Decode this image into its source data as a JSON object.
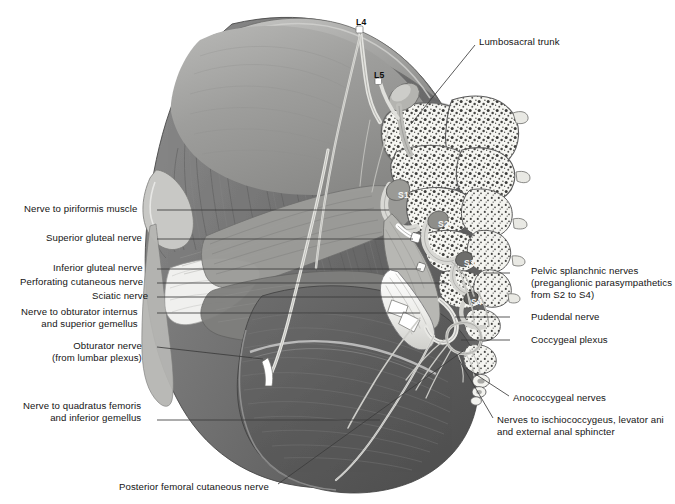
{
  "figure": {
    "background_color": "#ffffff",
    "line_color": "#3a3a3a",
    "muscle_color": "#6e6e6e",
    "bone_color": "#f2f2f0",
    "nerve_color": "#fdfdfb"
  },
  "labels_left": [
    {
      "id": "nerve-to-piriformis-muscle",
      "text": "Nerve to piriformis muscle",
      "x": 24,
      "y": 203,
      "width": 129,
      "leader_from_x": 157,
      "leader_from_y": 210,
      "leader_to_x": 389,
      "leader_to_y": 210
    },
    {
      "id": "superior-gluteal-nerve",
      "text": "Superior gluteal nerve",
      "x": 46,
      "y": 232,
      "width": 107,
      "leader_from_x": 157,
      "leader_from_y": 239,
      "leader_to_x": 413,
      "leader_to_y": 239
    },
    {
      "id": "inferior-gluteal-nerve",
      "text": "Inferior gluteal nerve",
      "x": 53,
      "y": 262,
      "width": 100,
      "leader_from_x": 157,
      "leader_from_y": 269,
      "leader_to_x": 421,
      "leader_to_y": 269
    },
    {
      "id": "perforating-cutaneous-nerve",
      "text": "Perforating cutaneous nerve",
      "x": 20,
      "y": 276,
      "width": 133,
      "leader_from_x": 157,
      "leader_from_y": 283,
      "leader_to_x": 447,
      "leader_to_y": 283
    },
    {
      "id": "sciatic-nerve",
      "text": "Sciatic nerve",
      "x": 92,
      "y": 290,
      "width": 61,
      "leader_from_x": 157,
      "leader_from_y": 297,
      "leader_to_x": 437,
      "leader_to_y": 297
    }
  ],
  "labels_left_multiline": [
    {
      "id": "nerve-to-obturator-internus",
      "lines": [
        "Nerve to obturator internus",
        "and superior gemellus"
      ],
      "x": 21,
      "y": 306,
      "width": 132,
      "leader_from_x": 157,
      "leader_from_y": 313,
      "leader_to_x": 420,
      "leader_to_y": 313
    },
    {
      "id": "obturator-nerve",
      "lines": [
        "Obturator nerve",
        "(from lumbar plexus)"
      ],
      "x": 52,
      "y": 340,
      "width": 101,
      "leader_from_x": 157,
      "leader_from_y": 347,
      "leader_to_x": 263,
      "leader_to_y": 359
    },
    {
      "id": "nerve-to-quadratus-femoris",
      "lines": [
        "Nerve to quadratus femoris",
        "and inferior gemellus"
      ],
      "x": 23,
      "y": 400,
      "width": 130,
      "leader_from_x": 157,
      "leader_from_y": 420,
      "leader_to_x": 380,
      "leader_to_y": 420
    }
  ],
  "labels_bottom": [
    {
      "id": "posterior-femoral-cutaneous-nerve",
      "text": "Posterior femoral cutaneous nerve",
      "x": 119,
      "y": 481,
      "width": 155,
      "leader_from_x": 278,
      "leader_from_y": 484,
      "leader_to_x": 463,
      "leader_to_y": 351
    }
  ],
  "labels_right": [
    {
      "id": "lumbosacral-trunk",
      "text": "Lumbosacral trunk",
      "x": 479,
      "y": 36,
      "leader_from_x": 475,
      "leader_from_y": 45,
      "leader_to_x": 411,
      "leader_to_y": 124
    },
    {
      "id": "pudendal-nerve",
      "text": "Pudendal nerve",
      "x": 531,
      "y": 311,
      "leader_from_x": 510,
      "leader_from_y": 317,
      "leader_to_x": 455,
      "leader_to_y": 317
    },
    {
      "id": "coccygeal-plexus",
      "text": "Coccygeal plexus",
      "x": 531,
      "y": 334,
      "leader_from_x": 510,
      "leader_from_y": 340,
      "leader_to_x": 461,
      "leader_to_y": 340
    },
    {
      "id": "anococcygeal-nerves",
      "text": "Anococcygeal nerves",
      "x": 513,
      "y": 392,
      "leader_from_x": 509,
      "leader_from_y": 396,
      "leader_to_x": 466,
      "leader_to_y": 368
    }
  ],
  "labels_right_multiline": [
    {
      "id": "pelvic-splanchnic-nerves",
      "lines": [
        "Pelvic splanchnic nerves",
        "(preganglionic parasympathetics",
        "from S2 to S4)"
      ],
      "x": 531,
      "y": 265,
      "leader_from_x": 510,
      "leader_from_y": 273,
      "leader_to_x": 483,
      "leader_to_y": 273
    },
    {
      "id": "nerves-to-ischiococcygeus",
      "lines": [
        "Nerves to ischiococcygeus, levator ani",
        "and external anal sphincter"
      ],
      "x": 497,
      "y": 414,
      "leader_from_x": 493,
      "leader_from_y": 418,
      "leader_to_x": 459,
      "leader_to_y": 360
    }
  ],
  "vertebral_levels": [
    {
      "id": "L4",
      "text": "L4",
      "x": 356,
      "y": 17,
      "style": "dark"
    },
    {
      "id": "L5",
      "text": "L5",
      "x": 374,
      "y": 70,
      "style": "dark"
    },
    {
      "id": "S1",
      "text": "S1",
      "x": 398,
      "y": 190,
      "style": "light"
    },
    {
      "id": "S2",
      "text": "S2",
      "x": 438,
      "y": 219,
      "style": "light"
    },
    {
      "id": "S3",
      "text": "S3",
      "x": 464,
      "y": 258,
      "style": "light"
    },
    {
      "id": "S4",
      "text": "S4",
      "x": 471,
      "y": 297,
      "style": "light"
    }
  ]
}
